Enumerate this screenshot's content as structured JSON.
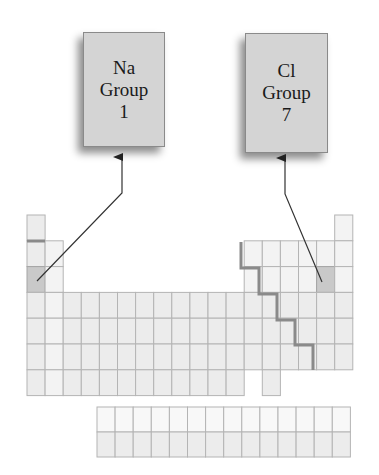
{
  "labels": {
    "na": {
      "line1": "Na",
      "line2": "Group",
      "line3": "1"
    },
    "cl": {
      "line1": "Cl",
      "line2": "Group",
      "line3": "7"
    }
  },
  "colors": {
    "label_box": "#d4d4d4",
    "cell": "#ececec",
    "highlight_cell": "#c9c9c9",
    "boundary_line": "#8a8a8a",
    "arrow": "#333333"
  },
  "table": {
    "main_columns": 18,
    "main_rows": 7,
    "f_block_columns": 14,
    "f_block_rows": 2,
    "highlighted": [
      {
        "element": "Na",
        "period": 3,
        "group": 1
      },
      {
        "element": "Cl",
        "period": 3,
        "group": 17
      }
    ]
  }
}
